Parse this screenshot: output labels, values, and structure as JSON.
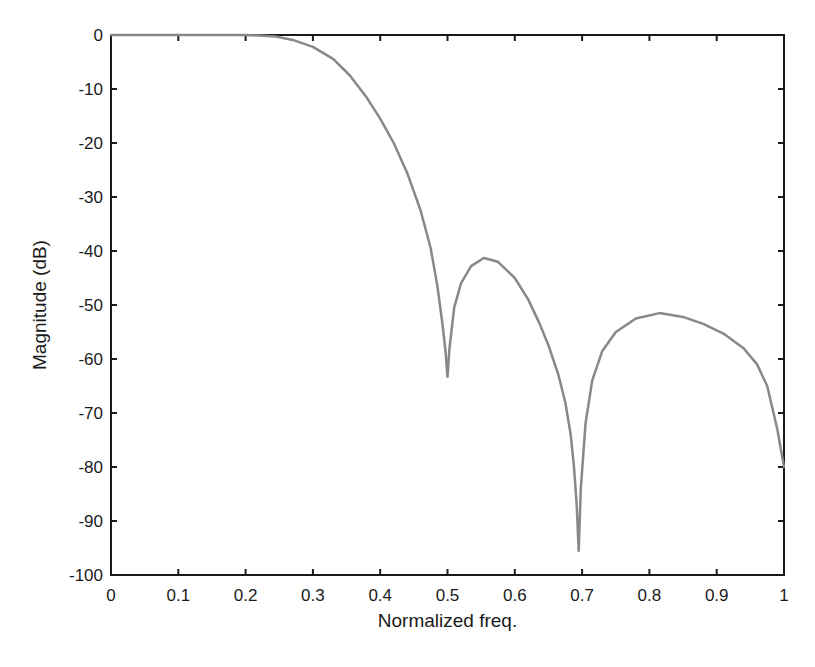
{
  "chart_data": {
    "type": "line",
    "title": "",
    "xlabel": "Normalized freq.",
    "ylabel": "Magnitude (dB)",
    "xlim": [
      0,
      1
    ],
    "ylim": [
      -100,
      0
    ],
    "grid": false,
    "legend": null,
    "xticks": [
      0,
      0.1,
      0.2,
      0.3,
      0.4,
      0.5,
      0.6,
      0.7,
      0.8,
      0.9,
      1
    ],
    "xtick_labels": [
      "0",
      "0.1",
      "0.2",
      "0.3",
      "0.4",
      "0.5",
      "0.6",
      "0.7",
      "0.8",
      "0.9",
      "1"
    ],
    "yticks": [
      0,
      -10,
      -20,
      -30,
      -40,
      -50,
      -60,
      -70,
      -80,
      -90,
      -100
    ],
    "ytick_labels": [
      "0",
      "-10",
      "-20",
      "-30",
      "-40",
      "-50",
      "-60",
      "-70",
      "-80",
      "-90",
      "-100"
    ],
    "series": [
      {
        "name": "magnitude response",
        "color": "#888888",
        "x": [
          0,
          0.05,
          0.1,
          0.15,
          0.2,
          0.22,
          0.245,
          0.27,
          0.3,
          0.33,
          0.355,
          0.38,
          0.4,
          0.42,
          0.44,
          0.46,
          0.475,
          0.485,
          0.492,
          0.497,
          0.5,
          0.503,
          0.51,
          0.52,
          0.535,
          0.554,
          0.575,
          0.6,
          0.62,
          0.637,
          0.65,
          0.665,
          0.675,
          0.683,
          0.688,
          0.692,
          0.695,
          0.698,
          0.705,
          0.715,
          0.73,
          0.75,
          0.78,
          0.815,
          0.85,
          0.88,
          0.91,
          0.94,
          0.96,
          0.975,
          0.99,
          1.0
        ],
        "y": [
          0,
          0,
          0,
          0,
          0,
          -0.1,
          -0.3,
          -0.9,
          -2.2,
          -4.4,
          -7.5,
          -11.6,
          -15.5,
          -20.0,
          -25.5,
          -32.5,
          -39.5,
          -46.5,
          -53,
          -58.5,
          -63.3,
          -58,
          -50.5,
          -46,
          -42.8,
          -41.3,
          -42,
          -45,
          -49,
          -53.5,
          -57.5,
          -63,
          -68,
          -74,
          -80,
          -87,
          -95.5,
          -84,
          -72,
          -64,
          -58.5,
          -55,
          -52.5,
          -51.5,
          -52.2,
          -53.5,
          -55.3,
          -58,
          -61,
          -65,
          -73,
          -80
        ]
      }
    ]
  },
  "plot_area": {
    "left": 111,
    "top": 35,
    "right": 784,
    "bottom": 575
  },
  "colors": {
    "axis": "#1a1a1a",
    "curve": "#888888",
    "background": "#ffffff"
  }
}
